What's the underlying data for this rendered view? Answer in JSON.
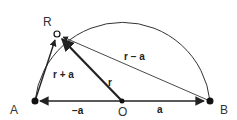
{
  "diagram": {
    "points": {
      "A": {
        "label": "A",
        "x": 35,
        "y": 101
      },
      "O": {
        "label": "O",
        "x": 122,
        "y": 101
      },
      "B": {
        "label": "B",
        "x": 210,
        "y": 101
      },
      "R": {
        "label": "R",
        "x": 57,
        "y": 34
      }
    },
    "vectors": [
      {
        "from": "O",
        "to": "A",
        "label": "−a"
      },
      {
        "from": "O",
        "to": "B",
        "label": "a"
      },
      {
        "from": "O",
        "to": "R",
        "label": "r"
      },
      {
        "from": "A",
        "to": "R",
        "label": "r + a"
      },
      {
        "from": "B",
        "to": "R",
        "label": "r − a"
      }
    ],
    "colors": {
      "stroke": "#222222",
      "background": "#ffffff"
    }
  }
}
